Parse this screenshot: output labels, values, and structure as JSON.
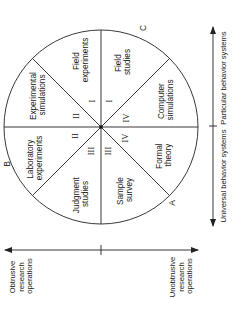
{
  "diagram": {
    "sectors": [
      {
        "id": "experimental-simulations",
        "lines": [
          "Experimental",
          "simulations"
        ],
        "numeral": "II"
      },
      {
        "id": "field-experiments",
        "lines": [
          "Field",
          "experiments"
        ],
        "numeral": "I"
      },
      {
        "id": "field-studies",
        "lines": [
          "Field",
          "studies"
        ],
        "numeral": "I"
      },
      {
        "id": "computer-simulations",
        "lines": [
          "Computer",
          "simulations"
        ],
        "numeral": "IV"
      },
      {
        "id": "formal-theory",
        "lines": [
          "Formal",
          "theory"
        ],
        "numeral": "IV"
      },
      {
        "id": "sample-survey",
        "lines": [
          "Sample",
          "survey"
        ],
        "numeral": "III"
      },
      {
        "id": "judgment-studies",
        "lines": [
          "Judgment",
          "studies"
        ],
        "numeral": "III"
      },
      {
        "id": "laboratory-experiments",
        "lines": [
          "Laboratory",
          "experiments"
        ],
        "numeral": "II"
      }
    ],
    "points": {
      "a": "A",
      "b": "B",
      "c": "C"
    },
    "vertical_axis": {
      "top_label": "Particular behavior systems",
      "bottom_label": "Universal behavior systems"
    },
    "horizontal_axis": {
      "left_label": [
        "Obtrusive",
        "research",
        "operations"
      ],
      "right_label": [
        "Unobtrusive",
        "research",
        "operations"
      ]
    },
    "colors": {
      "ink": "#1a1a1a",
      "background": "#ffffff"
    }
  }
}
